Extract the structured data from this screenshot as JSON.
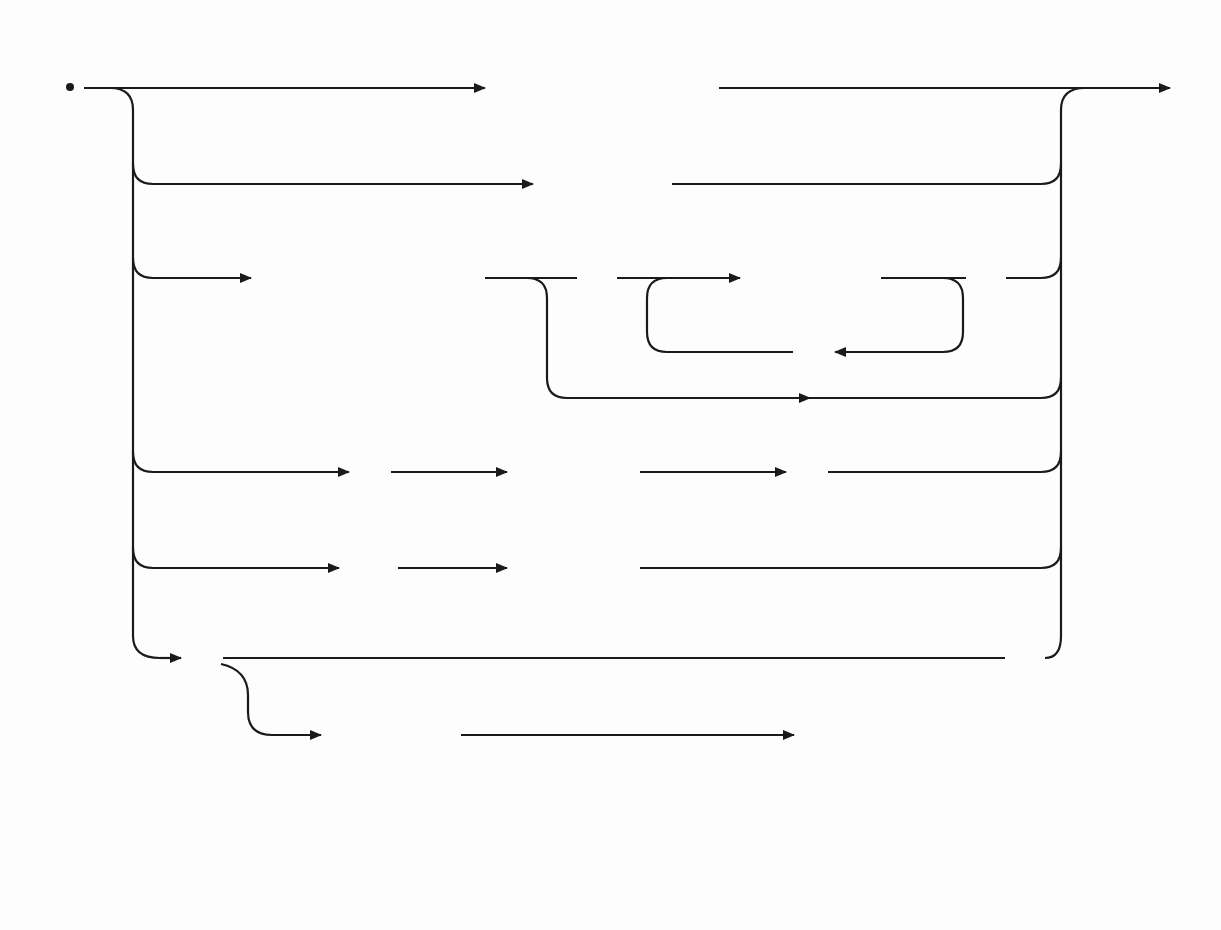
{
  "diagram": {
    "type": "syntax-diagram",
    "alternatives": [
      {
        "id": "unsigned-constant",
        "sequence": [
          "unsigned constant"
        ]
      },
      {
        "id": "variable",
        "sequence": [
          "variable"
        ]
      },
      {
        "id": "function-call",
        "sequence": [
          "function identifier",
          "(",
          "expression",
          ",",
          ")"
        ],
        "note": "optional parenthesized comma-separated expression list"
      },
      {
        "id": "parenthesized",
        "sequence": [
          "(",
          "expression",
          ")"
        ]
      },
      {
        "id": "not",
        "sequence": [
          "NOT",
          "factor"
        ]
      },
      {
        "id": "set",
        "sequence": [
          "[",
          "expression",
          "..",
          "expression",
          ",",
          "]"
        ],
        "note": "optional comma-separated list of elements or ranges"
      }
    ],
    "nodes": {
      "unsigned_constant": "unsigned constant",
      "variable": "variable",
      "function_identifier": "function identifier",
      "fn_lparen": "(",
      "fn_expression": "expression",
      "fn_comma": ",",
      "fn_rparen": ")",
      "par_lparen": "(",
      "par_expression": "expression",
      "par_rparen": ")",
      "not_keyword": "NOT",
      "not_factor": "factor",
      "set_lbracket": "[",
      "set_expression1": "expression",
      "set_range": "..",
      "set_expression2": "expression",
      "set_comma": ",",
      "set_rbracket": "]"
    }
  }
}
